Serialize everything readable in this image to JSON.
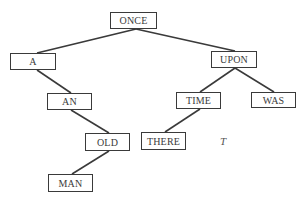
{
  "diagram": {
    "type": "binary-tree",
    "nodes": [
      {
        "id": "once",
        "label": "ONCE",
        "x": 110,
        "y": 12,
        "w": 47,
        "h": 17
      },
      {
        "id": "a",
        "label": "A",
        "x": 10,
        "y": 53,
        "w": 46,
        "h": 17
      },
      {
        "id": "upon",
        "label": "UPON",
        "x": 211,
        "y": 51,
        "w": 46,
        "h": 17
      },
      {
        "id": "an",
        "label": "AN",
        "x": 47,
        "y": 93,
        "w": 45,
        "h": 17
      },
      {
        "id": "time",
        "label": "TIME",
        "x": 176,
        "y": 92,
        "w": 45,
        "h": 17
      },
      {
        "id": "was",
        "label": "WAS",
        "x": 251,
        "y": 92,
        "w": 45,
        "h": 16
      },
      {
        "id": "old",
        "label": "OLD",
        "x": 85,
        "y": 133,
        "w": 45,
        "h": 18
      },
      {
        "id": "there",
        "label": "THERE",
        "x": 141,
        "y": 132,
        "w": 45,
        "h": 18
      },
      {
        "id": "man",
        "label": "MAN",
        "x": 48,
        "y": 174,
        "w": 45,
        "h": 18
      }
    ],
    "edges": [
      {
        "from": "once",
        "to": "a",
        "x1": 136,
        "y1": 29,
        "x2": 37,
        "y2": 53
      },
      {
        "from": "once",
        "to": "upon",
        "x1": 136,
        "y1": 29,
        "x2": 235,
        "y2": 51
      },
      {
        "from": "a",
        "to": "an",
        "x1": 37,
        "y1": 70,
        "x2": 71,
        "y2": 93
      },
      {
        "from": "an",
        "to": "old",
        "x1": 71,
        "y1": 110,
        "x2": 109,
        "y2": 133
      },
      {
        "from": "old",
        "to": "man",
        "x1": 109,
        "y1": 151,
        "x2": 72,
        "y2": 174
      },
      {
        "from": "upon",
        "to": "time",
        "x1": 235,
        "y1": 68,
        "x2": 200,
        "y2": 92
      },
      {
        "from": "upon",
        "to": "was",
        "x1": 235,
        "y1": 68,
        "x2": 274,
        "y2": 92
      },
      {
        "from": "time",
        "to": "there",
        "x1": 200,
        "y1": 109,
        "x2": 165,
        "y2": 132
      }
    ],
    "tree_label": "T"
  }
}
